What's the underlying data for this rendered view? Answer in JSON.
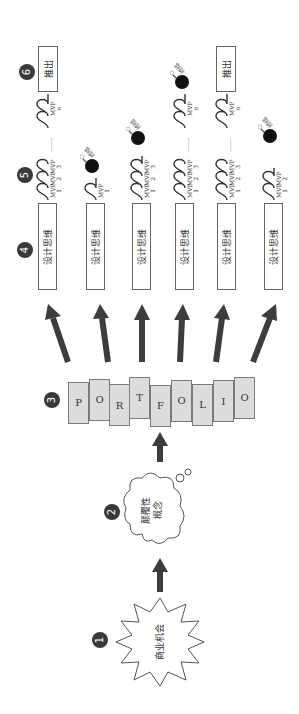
{
  "orientation": "rotated-90-ccw",
  "steps": [
    {
      "number": "1",
      "shape": "starburst",
      "label": "商业机会"
    },
    {
      "number": "2",
      "shape": "thought-cloud",
      "label_lines": [
        "颠覆性",
        "概念"
      ]
    },
    {
      "number": "3",
      "shape": "letter-tiles",
      "letters": [
        "P",
        "O",
        "R",
        "T",
        "F",
        "O",
        "L",
        "I",
        "O"
      ]
    },
    {
      "number": "4",
      "shape": "boxes",
      "label": "设计思维",
      "count": 6
    },
    {
      "number": "5",
      "shape": "mvp-sequences"
    },
    {
      "number": "6",
      "shape": "launch-boxes",
      "label": "推出"
    }
  ],
  "mvp": {
    "prefix": "MVP",
    "dots": "……",
    "n_sub": "n",
    "terminate_label": "终结"
  },
  "tracks": [
    {
      "design": "设计思维",
      "mvps": [
        "1",
        "2",
        "3",
        "n"
      ],
      "terminated": false,
      "launched": true
    },
    {
      "design": "设计思维",
      "mvps": [
        "1"
      ],
      "terminated": true,
      "launched": false
    },
    {
      "design": "设计思维",
      "mvps": [
        "1",
        "2",
        "3"
      ],
      "terminated": true,
      "launched": false
    },
    {
      "design": "设计思维",
      "mvps": [
        "1",
        "2",
        "3",
        "n"
      ],
      "terminated": true,
      "launched": false
    },
    {
      "design": "设计思维",
      "mvps": [
        "1",
        "2",
        "3",
        "n"
      ],
      "terminated": false,
      "launched": true
    },
    {
      "design": "设计思维",
      "mvps": [
        "1",
        "2"
      ],
      "terminated": true,
      "launched": false
    }
  ],
  "colors": {
    "badge": "#3a3a3a",
    "arrow": "#3d3d3d",
    "tile_fill": "#dcdcdc",
    "outline": "#666666"
  }
}
